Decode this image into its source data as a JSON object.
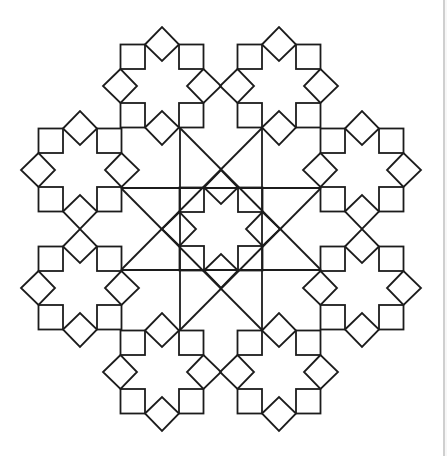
{
  "canvas": {
    "width": 447,
    "height": 456,
    "background": "#ffffff"
  },
  "style": {
    "stroke": "#1c1c1c",
    "stroke_width": 1.8
  },
  "page_edge": {
    "x": 443,
    "color": "#cfcfcf",
    "margin_color": "#f7f7f7"
  },
  "rosette_geometry": {
    "description": "8-point star rosette: 4 corner squares + 4 edge diamonds",
    "outer_frame": 41.5,
    "inner_offset": 17,
    "diamond_outer_apex": 59,
    "diamond_inner_apex": 25
  },
  "rosettes": [
    {
      "name": "center",
      "cx": 221,
      "cy": 229
    },
    {
      "name": "top-left",
      "cx": 162,
      "cy": 86
    },
    {
      "name": "top-right",
      "cx": 279,
      "cy": 86
    },
    {
      "name": "upper-left",
      "cx": 80,
      "cy": 170
    },
    {
      "name": "upper-right",
      "cx": 362,
      "cy": 170
    },
    {
      "name": "lower-left",
      "cx": 80,
      "cy": 288
    },
    {
      "name": "lower-right",
      "cx": 362,
      "cy": 288
    },
    {
      "name": "bottom-left",
      "cx": 162,
      "cy": 372
    },
    {
      "name": "bottom-right",
      "cx": 279,
      "cy": 372
    }
  ],
  "star_lines": {
    "description": "{8/3} star polygon connecting the central octagon vertices",
    "vertices": [
      [
        180,
        128
      ],
      [
        262,
        128
      ],
      [
        321,
        188
      ],
      [
        321,
        270
      ],
      [
        262,
        330
      ],
      [
        180,
        330
      ],
      [
        121,
        270
      ],
      [
        121,
        188
      ]
    ],
    "segments": [
      [
        [
          180,
          128
        ],
        [
          180,
          330
        ]
      ],
      [
        [
          262,
          128
        ],
        [
          262,
          330
        ]
      ],
      [
        [
          121,
          188
        ],
        [
          321,
          188
        ]
      ],
      [
        [
          121,
          270
        ],
        [
          321,
          270
        ]
      ],
      [
        [
          180,
          128
        ],
        [
          321,
          270
        ]
      ],
      [
        [
          262,
          128
        ],
        [
          121,
          270
        ]
      ],
      [
        [
          121,
          188
        ],
        [
          262,
          330
        ]
      ],
      [
        [
          321,
          188
        ],
        [
          180,
          330
        ]
      ]
    ]
  }
}
